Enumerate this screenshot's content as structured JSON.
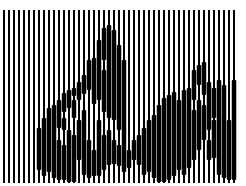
{
  "image": {
    "description": "Line-modulated optical illusion: vertical black stripes on white, thickened where a dark figure (a hand-like shape) appears",
    "width": 246,
    "height": 186,
    "colors": {
      "background": "#ffffff",
      "ink": "#000000"
    },
    "stripes": {
      "x_start": 3,
      "pitch": 5,
      "count": 47,
      "y_top": 10,
      "y_bottom": 183,
      "thin_width": 2,
      "thick_width": 4.5
    },
    "thick_segments": [
      {
        "col": 7,
        "ranges": [
          [
            128,
            170
          ]
        ]
      },
      {
        "col": 8,
        "ranges": [
          [
            118,
            176
          ]
        ]
      },
      {
        "col": 9,
        "ranges": [
          [
            108,
            172
          ]
        ]
      },
      {
        "col": 10,
        "ranges": [
          [
            105,
            178
          ]
        ]
      },
      {
        "col": 11,
        "ranges": [
          [
            100,
            128
          ],
          [
            140,
            180
          ]
        ]
      },
      {
        "col": 12,
        "ranges": [
          [
            93,
            112
          ],
          [
            118,
            130
          ],
          [
            145,
            180
          ]
        ]
      },
      {
        "col": 13,
        "ranges": [
          [
            90,
            108
          ],
          [
            130,
            182
          ]
        ]
      },
      {
        "col": 14,
        "ranges": [
          [
            88,
            96
          ],
          [
            100,
            118
          ],
          [
            135,
            182
          ]
        ]
      },
      {
        "col": 15,
        "ranges": [
          [
            82,
            100
          ],
          [
            120,
            160
          ]
        ]
      },
      {
        "col": 16,
        "ranges": [
          [
            75,
            94
          ],
          [
            110,
            175
          ]
        ]
      },
      {
        "col": 17,
        "ranges": [
          [
            60,
            90
          ],
          [
            140,
            178
          ]
        ]
      },
      {
        "col": 18,
        "ranges": [
          [
            58,
            104
          ],
          [
            150,
            176
          ]
        ]
      },
      {
        "col": 19,
        "ranges": [
          [
            40,
            100
          ],
          [
            120,
            176
          ]
        ]
      },
      {
        "col": 20,
        "ranges": [
          [
            28,
            60
          ],
          [
            70,
            112
          ],
          [
            135,
            170
          ]
        ]
      },
      {
        "col": 21,
        "ranges": [
          [
            25,
            118
          ],
          [
            130,
            165
          ]
        ]
      },
      {
        "col": 22,
        "ranges": [
          [
            30,
            120
          ],
          [
            140,
            164
          ]
        ]
      },
      {
        "col": 23,
        "ranges": [
          [
            45,
            130
          ],
          [
            145,
            166
          ]
        ]
      },
      {
        "col": 24,
        "ranges": [
          [
            60,
            172
          ]
        ]
      },
      {
        "col": 25,
        "ranges": [
          [
            150,
            168
          ]
        ]
      },
      {
        "col": 26,
        "ranges": [
          [
            140,
            160
          ]
        ]
      },
      {
        "col": 27,
        "ranges": [
          [
            135,
            165
          ]
        ]
      },
      {
        "col": 28,
        "ranges": [
          [
            128,
            175
          ]
        ]
      },
      {
        "col": 29,
        "ranges": [
          [
            120,
            172
          ]
        ]
      },
      {
        "col": 30,
        "ranges": [
          [
            115,
            178
          ]
        ]
      },
      {
        "col": 31,
        "ranges": [
          [
            105,
            182
          ]
        ]
      },
      {
        "col": 32,
        "ranges": [
          [
            98,
            182
          ]
        ]
      },
      {
        "col": 33,
        "ranges": [
          [
            95,
            180
          ]
        ]
      },
      {
        "col": 34,
        "ranges": [
          [
            92,
            176
          ]
        ]
      },
      {
        "col": 35,
        "ranges": [
          [
            100,
            170
          ]
        ]
      },
      {
        "col": 36,
        "ranges": [
          [
            90,
            175
          ]
        ]
      },
      {
        "col": 37,
        "ranges": [
          [
            88,
            168
          ]
        ]
      },
      {
        "col": 38,
        "ranges": [
          [
            70,
            100
          ],
          [
            110,
            160
          ]
        ]
      },
      {
        "col": 39,
        "ranges": [
          [
            65,
            85
          ],
          [
            100,
            150
          ]
        ]
      },
      {
        "col": 40,
        "ranges": [
          [
            62,
            95
          ],
          [
            105,
            140
          ]
        ]
      },
      {
        "col": 41,
        "ranges": [
          [
            82,
            130
          ],
          [
            140,
            160
          ]
        ]
      },
      {
        "col": 42,
        "ranges": [
          [
            88,
            118
          ],
          [
            120,
            158
          ]
        ]
      },
      {
        "col": 43,
        "ranges": [
          [
            80,
            175
          ]
        ]
      },
      {
        "col": 44,
        "ranges": [
          [
            85,
            178
          ]
        ]
      },
      {
        "col": 45,
        "ranges": [
          [
            120,
            180
          ]
        ]
      },
      {
        "col": 46,
        "ranges": [
          [
            80,
            180
          ]
        ]
      }
    ]
  }
}
